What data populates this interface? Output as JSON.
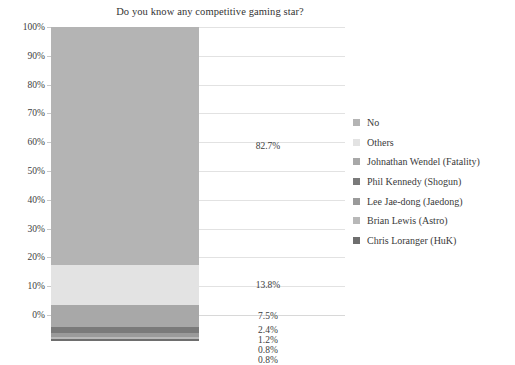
{
  "chart_data": {
    "type": "bar",
    "subtype": "stacked-100-percent",
    "title": "Do you know any competitive gaming star?",
    "xlabel": "",
    "ylabel": "",
    "ylim": [
      0,
      100
    ],
    "grid": true,
    "legend_position": "right",
    "categories": [
      ""
    ],
    "ytick_labels": [
      "100%",
      "90%",
      "80%",
      "70%",
      "60%",
      "50%",
      "40%",
      "30%",
      "20%",
      "10%",
      "0%"
    ],
    "ytick_values": [
      100,
      90,
      80,
      70,
      60,
      50,
      40,
      30,
      20,
      10,
      0
    ],
    "series": [
      {
        "name": "No",
        "value": 82.7,
        "label": "82.7%",
        "color": "#b4b4b4"
      },
      {
        "name": "Others",
        "value": 13.8,
        "label": "13.8%",
        "color": "#e3e3e3"
      },
      {
        "name": "Johnathan Wendel (Fatality)",
        "value": 7.5,
        "label": "7.5%",
        "color": "#a8a8a8"
      },
      {
        "name": "Phil Kennedy (Shogun)",
        "value": 2.4,
        "label": "2.4%",
        "color": "#7a7a7a"
      },
      {
        "name": "Lee Jae-dong (Jaedong)",
        "value": 1.2,
        "label": "1.2%",
        "color": "#9a9a9a"
      },
      {
        "name": "Brian Lewis (Astro)",
        "value": 0.8,
        "label": "0.8%",
        "color": "#b8b8b8"
      },
      {
        "name": "Chris Loranger (HuK)",
        "value": 0.8,
        "label": "0.8%",
        "color": "#6e6e6e"
      }
    ]
  },
  "legend": {
    "items": [
      {
        "label": "No"
      },
      {
        "label": "Others"
      },
      {
        "label": "Johnathan Wendel (Fatality)"
      },
      {
        "label": "Phil Kennedy (Shogun)"
      },
      {
        "label": "Lee Jae-dong (Jaedong)"
      },
      {
        "label": "Brian Lewis (Astro)"
      },
      {
        "label": "Chris Loranger (HuK)"
      }
    ]
  }
}
